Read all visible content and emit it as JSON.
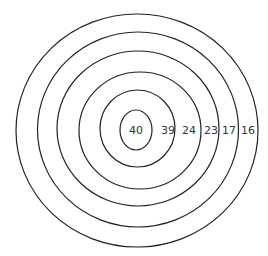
{
  "diagram": {
    "type": "concentric-rings",
    "center": {
      "x": 137,
      "y": 130
    },
    "rings": [
      {
        "label": "40",
        "rx": 16,
        "ry": 20,
        "label_x": 136
      },
      {
        "label": "39",
        "rx": 38,
        "ry": 38,
        "label_x": 168
      },
      {
        "label": "24",
        "rx": 61,
        "ry": 58,
        "label_x": 189
      },
      {
        "label": "23",
        "rx": 81,
        "ry": 77,
        "label_x": 211
      },
      {
        "label": "17",
        "rx": 101,
        "ry": 97,
        "label_x": 229
      },
      {
        "label": "16",
        "rx": 121,
        "ry": 116,
        "label_x": 248
      }
    ],
    "stroke_color": "#222222",
    "label_color": "#333333"
  }
}
